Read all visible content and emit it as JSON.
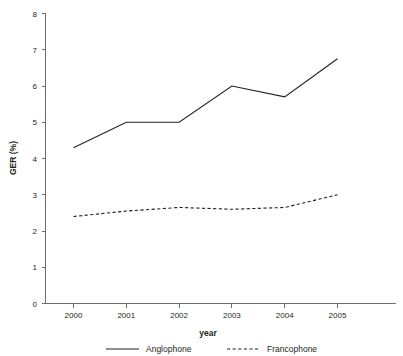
{
  "chart_data": {
    "type": "line",
    "title": "",
    "xlabel": "year",
    "ylabel": "GER (%)",
    "categories": [
      "2000",
      "2001",
      "2002",
      "2003",
      "2004",
      "2005"
    ],
    "x": [
      2000,
      2001,
      2002,
      2003,
      2004,
      2005
    ],
    "series": [
      {
        "name": "Anglophone",
        "style": "solid",
        "values": [
          4.3,
          5.0,
          5.0,
          6.0,
          5.7,
          6.75
        ]
      },
      {
        "name": "Francophone",
        "style": "dashed",
        "values": [
          2.4,
          2.55,
          2.65,
          2.6,
          2.65,
          3.0
        ]
      }
    ],
    "ylim": [
      0,
      8
    ],
    "yticks": [
      0,
      1,
      2,
      3,
      4,
      5,
      6,
      7,
      8
    ],
    "ytick_labels": [
      "0",
      "1",
      "2",
      "3",
      "4",
      "5",
      "6",
      "7",
      "8"
    ],
    "xtick_labels": [
      "2000",
      "2001",
      "2002",
      "2003",
      "2004",
      "2005"
    ],
    "grid": false,
    "legend_position": "bottom"
  },
  "axes": {
    "y_title": "GER (%)",
    "x_title": "year"
  },
  "legend": {
    "entries": [
      {
        "label": "Anglophone",
        "style": "solid"
      },
      {
        "label": "Francophone",
        "style": "dashed"
      }
    ]
  }
}
